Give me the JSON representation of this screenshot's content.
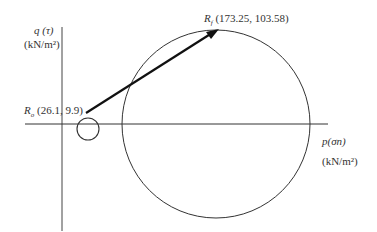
{
  "axes": {
    "y_label": "q (τ)",
    "y_unit": "(kN/m²)",
    "x_label": "p(σn)",
    "x_unit": "(kN/m²)"
  },
  "points": {
    "initial": {
      "name": "R",
      "subscript": "o",
      "coords": "(26.1,  9.9)"
    },
    "final": {
      "name": "R",
      "subscript": "f",
      "coords": "(173.25,  103.58)"
    }
  },
  "colors": {
    "line": "#222222",
    "arrow": "#111111"
  }
}
